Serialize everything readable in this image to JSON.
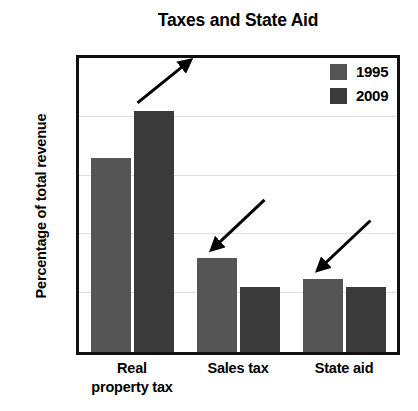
{
  "chart_data": {
    "type": "bar",
    "title": "Taxes and State Aid",
    "xlabel": "",
    "ylabel": "Percentage of total revenue",
    "categories": [
      "Real property tax",
      "Sales tax",
      "State aid"
    ],
    "category_lines": [
      [
        "Real",
        "property tax"
      ],
      [
        "Sales tax"
      ],
      [
        "State aid"
      ]
    ],
    "series": [
      {
        "name": "1995",
        "color": "#555555",
        "values": [
          33,
          16,
          12.5
        ]
      },
      {
        "name": "2009",
        "color": "#3a3a3a",
        "values": [
          41,
          11,
          11
        ]
      }
    ],
    "ylim": [
      0,
      50
    ],
    "yticks": [
      0,
      10,
      20,
      30,
      40,
      50
    ],
    "ytick_labels": [
      "0%",
      "10%",
      "20%",
      "30%",
      "40%",
      "50%"
    ],
    "grid": true,
    "grid_axis": "y",
    "legend_position": "top-right-inside",
    "annotations": [
      {
        "name": "arrow-up-real-property-tax",
        "direction": "up-right",
        "target_category": "Real property tax",
        "target_series": "2009"
      },
      {
        "name": "arrow-down-sales-tax",
        "direction": "down-left",
        "target_category": "Sales tax",
        "target_series": "1995"
      },
      {
        "name": "arrow-down-state-aid",
        "direction": "down-left",
        "target_category": "State aid",
        "target_series": "1995"
      }
    ]
  },
  "colors": {
    "series_1995": "#555555",
    "series_2009": "#3a3a3a",
    "axis": "#111111",
    "gridline": "#e2e2e2",
    "text": "#000000",
    "background": "#ffffff"
  }
}
